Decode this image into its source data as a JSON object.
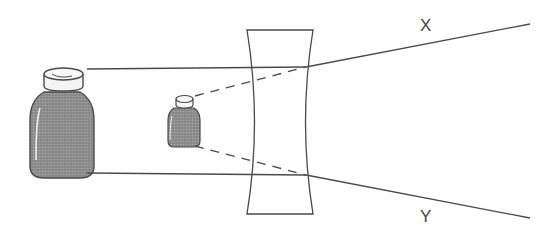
{
  "diagram": {
    "labels": {
      "ray_top": "X",
      "ray_bottom": "Y"
    },
    "colors": {
      "line": "#4a4a4a",
      "bottle_body": "#8c8c8c",
      "bottle_shadow": "#6e6e6e",
      "cap_fill": "#f4f4f4",
      "background": "#ffffff"
    },
    "elements": {
      "object": "large bottle (real object)",
      "image": "small bottle (virtual image)",
      "lens": "concave lens",
      "rays": [
        "ray X (upper)",
        "ray Y (lower)"
      ]
    }
  }
}
